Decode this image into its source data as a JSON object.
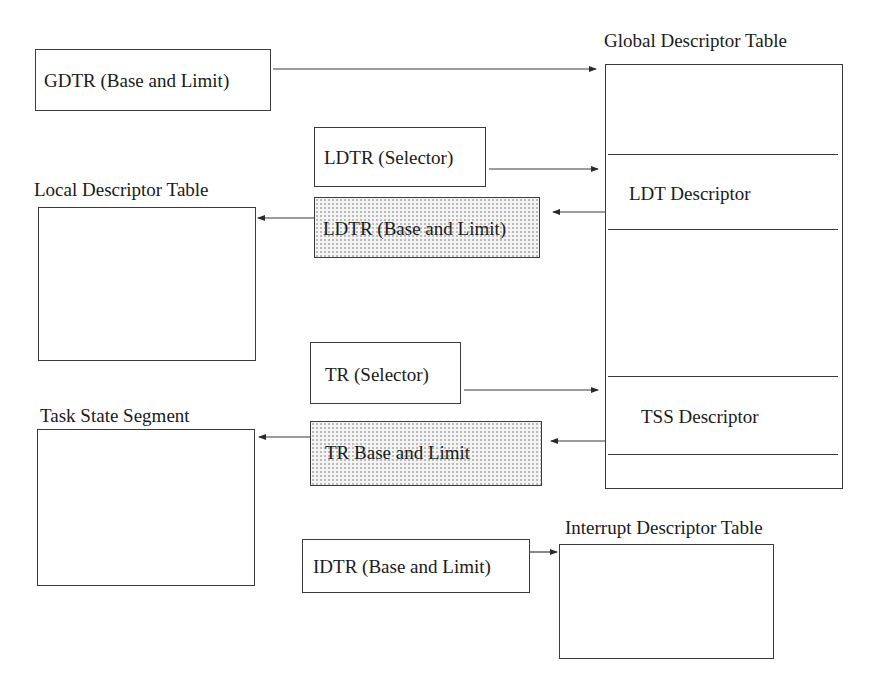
{
  "diagram": {
    "registers": {
      "gdtr": {
        "label": "GDTR (Base and Limit)"
      },
      "ldtr_selector": {
        "label": "LDTR (Selector)"
      },
      "ldtr_base_limit": {
        "label": "LDTR (Base and Limit)"
      },
      "tr_selector": {
        "label": "TR (Selector)"
      },
      "tr_base_limit": {
        "label": "TR Base and Limit"
      },
      "idtr": {
        "label": "IDTR (Base and Limit)"
      }
    },
    "tables": {
      "gdt": {
        "title": "Global Descriptor Table",
        "entries": [
          {
            "label": ""
          },
          {
            "label": "LDT Descriptor"
          },
          {
            "label": ""
          },
          {
            "label": "TSS Descriptor"
          },
          {
            "label": ""
          }
        ]
      },
      "ldt": {
        "title": "Local Descriptor Table"
      },
      "tss": {
        "title": "Task State Segment"
      },
      "idt": {
        "title": "Interrupt Descriptor Table"
      }
    },
    "arrows": [
      {
        "from": "GDTR (Base and Limit)",
        "to": "Global Descriptor Table"
      },
      {
        "from": "LDTR (Selector)",
        "to": "LDT Descriptor"
      },
      {
        "from": "LDT Descriptor",
        "to": "LDTR (Base and Limit)"
      },
      {
        "from": "LDTR (Base and Limit)",
        "to": "Local Descriptor Table"
      },
      {
        "from": "TR (Selector)",
        "to": "TSS Descriptor"
      },
      {
        "from": "TSS Descriptor",
        "to": "TR Base and Limit"
      },
      {
        "from": "TR Base and Limit",
        "to": "Task State Segment"
      },
      {
        "from": "IDTR (Base and Limit)",
        "to": "Interrupt Descriptor Table"
      }
    ],
    "colors": {
      "line": "#3a3a3a",
      "text": "#1a1a1a",
      "cached_register_fill": "#f4f4f4"
    }
  }
}
